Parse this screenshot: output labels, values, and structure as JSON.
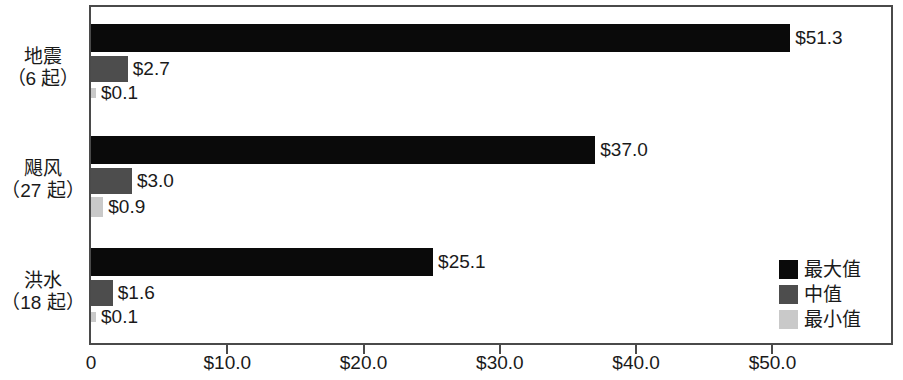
{
  "chart_data": {
    "type": "bar",
    "orientation": "horizontal",
    "title": "",
    "xlabel": "",
    "ylabel": "",
    "xlim": [
      0,
      58.7
    ],
    "grid": false,
    "legend_position": "bottom-right",
    "categories": [
      "地震",
      "飓风",
      "洪水"
    ],
    "category_counts": [
      "（6 起）",
      "（27 起）",
      "（18 起）"
    ],
    "series": [
      {
        "name": "最大值",
        "color": "#0a0a0a",
        "values": [
          51.3,
          37.0,
          25.1
        ],
        "labels": [
          "$51.3",
          "$37.0",
          "$25.1"
        ]
      },
      {
        "name": "中值",
        "color": "#4d4d4d",
        "values": [
          2.7,
          3.0,
          1.6
        ],
        "labels": [
          "$2.7",
          "$3.0",
          "$1.6"
        ]
      },
      {
        "name": "最小值",
        "color": "#c9c9c9",
        "values": [
          0.1,
          0.9,
          0.1
        ],
        "labels": [
          "$0.1",
          "$0.9",
          "$0.1"
        ]
      }
    ],
    "xticks": [
      0,
      10,
      20,
      30,
      40,
      50
    ],
    "xtick_labels": [
      "0",
      "$10.0",
      "$20.0",
      "$30.0",
      "$40.0",
      "$50.0"
    ]
  },
  "legend": {
    "items": [
      {
        "label": "最大值",
        "swatch": "legend-swatch-max"
      },
      {
        "label": "中值",
        "swatch": "legend-swatch-med"
      },
      {
        "label": "最小值",
        "swatch": "legend-swatch-min"
      }
    ]
  },
  "axis": {
    "ticks": [
      {
        "label": "0",
        "value": 0
      },
      {
        "label": "$10.0",
        "value": 10
      },
      {
        "label": "$20.0",
        "value": 20
      },
      {
        "label": "$30.0",
        "value": 30
      },
      {
        "label": "$40.0",
        "value": 40
      },
      {
        "label": "$50.0",
        "value": 50
      }
    ]
  }
}
